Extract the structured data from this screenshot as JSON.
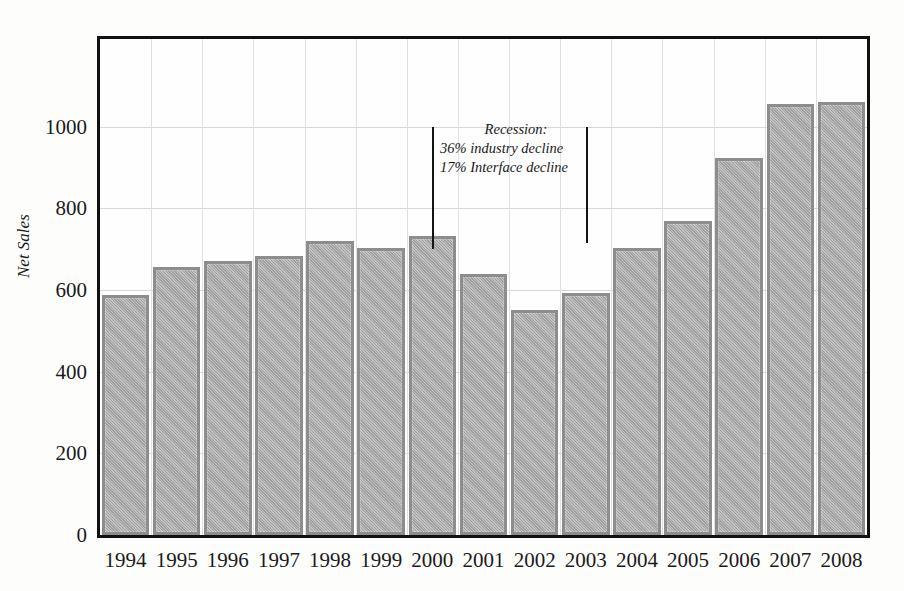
{
  "chart_data": {
    "type": "bar",
    "title": "",
    "xlabel": "",
    "ylabel": "Net Sales",
    "categories": [
      "1994",
      "1995",
      "1996",
      "1997",
      "1998",
      "1999",
      "2000",
      "2001",
      "2002",
      "2003",
      "2004",
      "2005",
      "2006",
      "2007",
      "2008"
    ],
    "values": [
      588,
      657,
      672,
      683,
      720,
      703,
      732,
      640,
      550,
      593,
      702,
      770,
      923,
      1055,
      1060
    ],
    "ylim": [
      0,
      1215
    ],
    "yticks": [
      0,
      200,
      400,
      600,
      800,
      1000
    ],
    "ytick_labels": [
      "0",
      "200",
      "400",
      "600",
      "800",
      "1000"
    ],
    "grid": true,
    "legend": null,
    "bar_color": "#a8a8a8",
    "bar_edge_color": "#8d8d8d",
    "frame_color": "#111111",
    "grid_color": "#d8d8d8",
    "annotations": [
      {
        "name": "recession-note",
        "lines": [
          "Recession:",
          "36% industry decline",
          "17% Interface decline"
        ],
        "style": "italic"
      },
      {
        "name": "recession-start-marker",
        "kind": "vertical-line",
        "x_value": 2000,
        "y_from": 700,
        "y_to": 1000
      },
      {
        "name": "recession-end-marker",
        "kind": "vertical-line",
        "x_value": 2003,
        "y_from": 715,
        "y_to": 1000
      }
    ]
  },
  "axis": {
    "y_title": "Net Sales"
  }
}
